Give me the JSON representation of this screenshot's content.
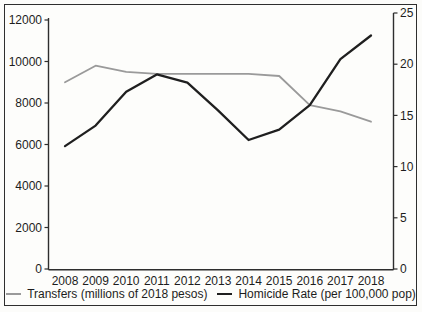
{
  "chart_data": {
    "type": "line",
    "title": "",
    "x": [
      "2008",
      "2009",
      "2010",
      "2011",
      "2012",
      "2013",
      "2014",
      "2015",
      "2016",
      "2017",
      "2018"
    ],
    "series": [
      {
        "name": "Transfers (millions of 2018 pesos)",
        "axis": "left",
        "color": "#9a9a9a",
        "values": [
          9000,
          9800,
          9500,
          9400,
          9400,
          9400,
          9400,
          9300,
          7900,
          7600,
          7100
        ]
      },
      {
        "name": "Homicide Rate (per 100,000 pop)",
        "axis": "right",
        "color": "#1f1f1f",
        "values": [
          12,
          14,
          17.3,
          19,
          18.2,
          15.5,
          12.6,
          13.6,
          16,
          20.5,
          22.8
        ]
      }
    ],
    "left_axis": {
      "ylim": [
        0,
        12000
      ],
      "ticks": [
        0,
        2000,
        4000,
        6000,
        8000,
        10000,
        12000
      ],
      "tick_labels": [
        "0",
        "2000",
        "4000",
        "6000",
        "8000",
        "10000",
        "12000"
      ]
    },
    "right_axis": {
      "ylim": [
        0,
        25
      ],
      "ticks": [
        0,
        5,
        10,
        15,
        20,
        25
      ],
      "tick_labels": [
        "0",
        "5",
        "10",
        "15",
        "20",
        "25"
      ]
    },
    "grid": false,
    "legend_position": "bottom"
  },
  "colors": {
    "axis": "#2e2e2e",
    "text": "#1d1d1d",
    "frame": "#2e2e2e",
    "background": "#fdfdfb",
    "transfers_line": "#9a9a9a",
    "homicide_line": "#1f1f1f"
  }
}
